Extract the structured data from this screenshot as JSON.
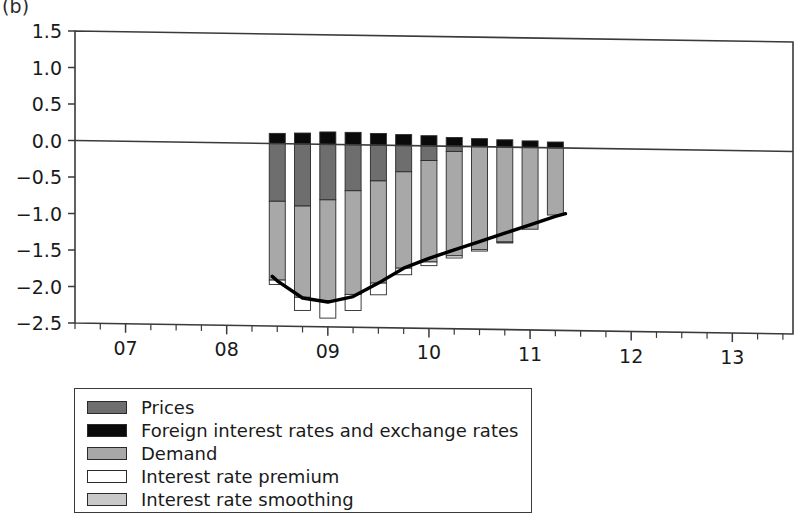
{
  "panel": {
    "label": "(b)"
  },
  "legend": {
    "items": [
      {
        "label": "Prices",
        "color": "#6e6e6e"
      },
      {
        "label": "Foreign interest rates and exchange rates",
        "color": "#0a0a0a"
      },
      {
        "label": "Demand",
        "color": "#a8a8a8"
      },
      {
        "label": "Interest rate premium",
        "color": "#ffffff"
      },
      {
        "label": "Interest rate smoothing",
        "color": "#c9c9c9"
      }
    ]
  },
  "chart_data": {
    "type": "bar",
    "subtype": "stacked-bar-with-line",
    "title": "",
    "xlabel": "",
    "ylabel": "",
    "ylim": [
      -2.5,
      1.5
    ],
    "xlim": [
      2006.5,
      2013.6
    ],
    "grid": false,
    "legend_position": "below-plot-left",
    "ytick_labels": [
      "1.5",
      "1.0",
      "0.5",
      "0.0",
      "-0.5",
      "-1.0",
      "-1.5",
      "-2.0",
      "-2.5"
    ],
    "ytick_values": [
      1.5,
      1.0,
      0.5,
      0.0,
      -0.5,
      -1.0,
      -1.5,
      -2.0,
      -2.5
    ],
    "xtick_labels": [
      "07",
      "08",
      "09",
      "10",
      "11",
      "12",
      "13"
    ],
    "xtick_values": [
      2007,
      2008,
      2009,
      2010,
      2011,
      2012,
      2013
    ],
    "minor_tick_step": 0.25,
    "x": [
      2008.5,
      2008.75,
      2009.0,
      2009.25,
      2009.5,
      2009.75,
      2010.0,
      2010.25,
      2010.5,
      2010.75,
      2011.0,
      2011.25
    ],
    "categories": [
      "08Q3",
      "08Q4",
      "09Q1",
      "09Q2",
      "09Q3",
      "09Q4",
      "10Q1",
      "10Q2",
      "10Q3",
      "10Q4",
      "11Q1",
      "11Q2"
    ],
    "series": [
      {
        "name": "Foreign interest rates and exchange rates",
        "color": "#0a0a0a",
        "values": [
          0.14,
          0.15,
          0.17,
          0.17,
          0.16,
          0.15,
          0.14,
          0.12,
          0.11,
          0.1,
          0.09,
          0.08
        ]
      },
      {
        "name": "Prices",
        "color": "#6e6e6e",
        "values": [
          -0.79,
          -0.85,
          -0.76,
          -0.63,
          -0.49,
          -0.36,
          -0.2,
          -0.07,
          0.0,
          0.0,
          0.0,
          0.0
        ]
      },
      {
        "name": "Demand",
        "color": "#a8a8a8",
        "values": [
          -1.08,
          -1.25,
          -1.38,
          -1.42,
          -1.4,
          -1.32,
          -1.39,
          -1.43,
          -1.41,
          -1.3,
          -1.12,
          -0.92
        ]
      },
      {
        "name": "Interest rate premium",
        "color": "#ffffff",
        "values": [
          -0.06,
          -0.18,
          -0.24,
          -0.22,
          -0.16,
          -0.09,
          -0.05,
          -0.03,
          -0.02,
          -0.01,
          0.0,
          0.0
        ]
      },
      {
        "name": "Interest rate smoothing",
        "color": "#c9c9c9",
        "values": [
          0.0,
          0.0,
          0.0,
          0.0,
          0.0,
          0.0,
          0.0,
          0.0,
          0.0,
          0.0,
          0.0,
          0.0
        ]
      }
    ],
    "total_line": {
      "name": "Total",
      "color": "#000000",
      "x": [
        2008.45,
        2008.5,
        2008.75,
        2009.0,
        2009.25,
        2009.5,
        2009.75,
        2010.0,
        2010.25,
        2010.5,
        2010.75,
        2011.0,
        2011.25,
        2011.35
      ],
      "values": [
        -1.82,
        -1.88,
        -2.11,
        -2.16,
        -2.08,
        -1.89,
        -1.68,
        -1.54,
        -1.42,
        -1.3,
        -1.18,
        -1.06,
        -0.94,
        -0.9
      ]
    }
  }
}
